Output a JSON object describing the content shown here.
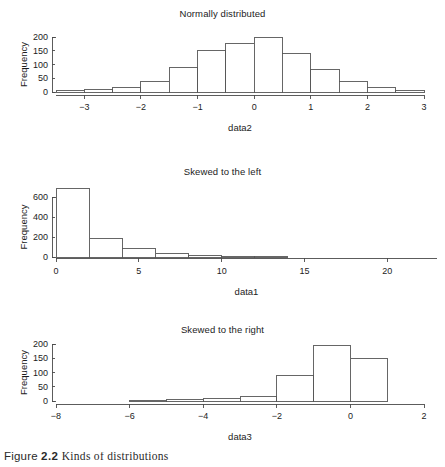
{
  "figure": {
    "caption_number": "2.2",
    "caption_label": "Figure",
    "caption_text": "Kinds of distributions"
  },
  "chart_data": [
    {
      "type": "bar",
      "title": "Normally distributed",
      "xlabel": "data2",
      "ylabel": "Frequency",
      "grid": false,
      "legend": "none",
      "xlim": [
        -3.5,
        3.0
      ],
      "ylim": [
        0,
        200
      ],
      "xticks": [
        -3,
        -2,
        -1,
        0,
        1,
        2,
        3
      ],
      "xtick_labels": [
        "−3",
        "−2",
        "−1",
        "0",
        "1",
        "2",
        "3"
      ],
      "yticks": [
        0,
        50,
        100,
        150,
        200
      ],
      "ytick_labels": [
        "0",
        "50",
        "100",
        "150",
        "200"
      ],
      "bin_width": 0.5,
      "bin_edges": [
        -3.5,
        -3.0,
        -2.5,
        -2.0,
        -1.5,
        -1.0,
        -0.5,
        0.0,
        0.5,
        1.0,
        1.5,
        2.0,
        2.5,
        3.0
      ],
      "categories": [
        "-3.5 to -3.0",
        "-3.0 to -2.5",
        "-2.5 to -2.0",
        "-2.0 to -1.5",
        "-1.5 to -1.0",
        "-1.0 to -0.5",
        "-0.5 to 0.0",
        "0.0 to 0.5",
        "0.5 to 1.0",
        "1.0 to 1.5",
        "1.5 to 2.0",
        "2.0 to 2.5",
        "2.5 to 3.0"
      ],
      "values": [
        5,
        10,
        17,
        40,
        88,
        152,
        178,
        200,
        140,
        83,
        37,
        15,
        4
      ]
    },
    {
      "type": "bar",
      "title": "Skewed to the left",
      "xlabel": "data1",
      "ylabel": "Frequency",
      "grid": false,
      "legend": "none",
      "xlim": [
        0,
        23
      ],
      "ylim": [
        0,
        690
      ],
      "xticks": [
        0,
        5,
        10,
        15,
        20
      ],
      "xtick_labels": [
        "0",
        "5",
        "10",
        "15",
        "20"
      ],
      "yticks": [
        0,
        200,
        400,
        600
      ],
      "ytick_labels": [
        "0",
        "200",
        "400",
        "600"
      ],
      "bin_width": 2,
      "bin_edges": [
        0,
        2,
        4,
        6,
        8,
        10,
        12,
        14
      ],
      "categories": [
        "0 to 2",
        "2 to 4",
        "4 to 6",
        "6 to 8",
        "8 to 10",
        "10 to 12",
        "12 to 14"
      ],
      "values": [
        690,
        190,
        85,
        40,
        15,
        4,
        1
      ]
    },
    {
      "type": "bar",
      "title": "Skewed to the right",
      "xlabel": "data3",
      "ylabel": "Frequency",
      "grid": false,
      "legend": "none",
      "xlim": [
        -8,
        2
      ],
      "ylim": [
        0,
        200
      ],
      "xticks": [
        -8,
        -6,
        -4,
        -2,
        0,
        2
      ],
      "xtick_labels": [
        "−8",
        "−6",
        "−4",
        "−2",
        "0",
        "2"
      ],
      "yticks": [
        0,
        50,
        100,
        150,
        200
      ],
      "ytick_labels": [
        "0",
        "50",
        "100",
        "150",
        "200"
      ],
      "bin_width": 1,
      "bin_edges": [
        -6,
        -5,
        -4,
        -3,
        -2,
        -1,
        0,
        1
      ],
      "categories": [
        "-6 to -5",
        "-5 to -4",
        "-4 to -3",
        "-3 to -2",
        "-2 to -1",
        "-1 to 0",
        "0 to 1"
      ],
      "values": [
        1,
        5,
        9,
        16,
        88,
        195,
        150
      ]
    }
  ]
}
